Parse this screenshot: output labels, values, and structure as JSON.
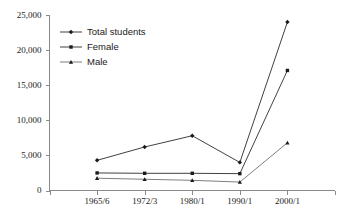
{
  "chart_data": {
    "type": "line",
    "title": "",
    "subtitle": "",
    "xlabel": "",
    "ylabel": "",
    "categories": [
      "1965/6",
      "1972/3",
      "1980/1",
      "1990/1",
      "2000/1"
    ],
    "series": [
      {
        "name": "Total students",
        "marker": "diamond",
        "values": [
          4300,
          6200,
          7800,
          4000,
          24000
        ]
      },
      {
        "name": "Female",
        "marker": "square",
        "values": [
          2500,
          2450,
          2450,
          2400,
          17100
        ]
      },
      {
        "name": "Male",
        "marker": "triangle",
        "values": [
          1750,
          1600,
          1450,
          1200,
          6800
        ]
      }
    ],
    "ylim": [
      0,
      25000
    ],
    "ytick_values": [
      0,
      5000,
      10000,
      15000,
      20000,
      25000
    ],
    "ytick_labels": [
      "0",
      "5,000",
      "10,000",
      "15,000",
      "20,000",
      "25,000"
    ],
    "grid": false,
    "legend_position": "top-left",
    "legend_entries": [
      "Total students",
      "Female",
      "Male"
    ],
    "colors": {
      "total_students": "#2b2b2b",
      "female": "#2b2b2b",
      "male": "#6f6f6f",
      "axis": "#8a8a8a",
      "text": "#1a1a1a",
      "background": "#ffffff"
    }
  }
}
